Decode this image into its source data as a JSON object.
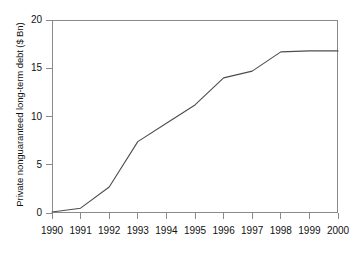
{
  "chart_data": {
    "type": "line",
    "title": "",
    "xlabel": "",
    "ylabel": "Private nonguaranteed long-term debt ($ Bn)",
    "x": [
      1990,
      1991,
      1992,
      1993,
      1994,
      1995,
      1996,
      1997,
      1998,
      1999,
      2000
    ],
    "categories": [
      "1990",
      "1991",
      "1992",
      "1993",
      "1994",
      "1995",
      "1996",
      "1997",
      "1998",
      "1999",
      "2000"
    ],
    "values": [
      0.1,
      0.5,
      2.7,
      7.4,
      9.3,
      11.2,
      14.0,
      14.7,
      16.7,
      16.8,
      16.8
    ],
    "series": [
      {
        "name": "Private nonguaranteed long-term debt",
        "values": [
          0.1,
          0.5,
          2.7,
          7.4,
          9.3,
          11.2,
          14.0,
          14.7,
          16.7,
          16.8,
          16.8
        ]
      }
    ],
    "xlim": [
      1990,
      2000
    ],
    "ylim": [
      0,
      20
    ],
    "yticks": [
      0,
      5,
      10,
      15,
      20
    ],
    "ytick_labels": [
      "0",
      "5",
      "10",
      "15",
      "20"
    ],
    "xticks": [
      1990,
      1991,
      1992,
      1993,
      1994,
      1995,
      1996,
      1997,
      1998,
      1999,
      2000
    ],
    "xtick_labels": [
      "1990",
      "1991",
      "1992",
      "1993",
      "1994",
      "1995",
      "1996",
      "1997",
      "1998",
      "1999",
      "2000"
    ],
    "grid": false,
    "legend": false,
    "legend_position": "none",
    "line_color": "#4d4d4d",
    "axis_color": "#8a8a8a",
    "background_color": "#ffffff"
  }
}
